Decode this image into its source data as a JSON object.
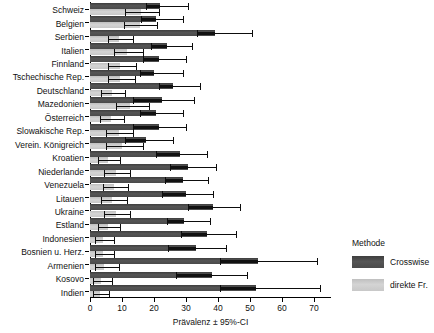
{
  "chart_data": {
    "type": "bar",
    "orientation": "horizontal",
    "title": "",
    "xlabel": "Prävalenz ± 95%-CI",
    "ylabel": "",
    "xlim": [
      0,
      75
    ],
    "xticks": [
      0,
      10,
      20,
      30,
      40,
      50,
      60,
      70
    ],
    "grid": false,
    "legend": {
      "title": "Methode",
      "position": "right",
      "entries": [
        {
          "name": "Crosswise",
          "color": "#4a4a4a"
        },
        {
          "name": "direkte Fr.",
          "color": "#c9c9c9"
        }
      ]
    },
    "categories": [
      "Schweiz",
      "Belgien",
      "Serbien",
      "Italien",
      "Finnland",
      "Tschechische Rep.",
      "Deutschland",
      "Mazedonien",
      "Österreich",
      "Slowakische Rep.",
      "Verein. Königreich",
      "Kroatien",
      "Niederlande",
      "Venezuela",
      "Litauen",
      "Ukraine",
      "Estland",
      "Indonesien",
      "Bosnien u. Herz.",
      "Armenien",
      "Kosovo",
      "Indien"
    ],
    "series": [
      {
        "name": "Crosswise",
        "color": "#4a4a4a",
        "values": [
          22.0,
          20.5,
          39.0,
          24.0,
          21.5,
          20.0,
          26.0,
          22.5,
          20.5,
          21.5,
          17.5,
          28.0,
          30.5,
          29.0,
          30.0,
          38.5,
          29.5,
          36.5,
          33.0,
          52.5,
          38.0,
          52.0
        ],
        "ci_low": [
          17.5,
          16.0,
          33.5,
          19.0,
          16.5,
          15.5,
          21.5,
          13.5,
          15.5,
          13.5,
          11.0,
          20.5,
          25.0,
          23.5,
          22.5,
          30.5,
          24.0,
          28.5,
          24.5,
          40.5,
          27.0,
          40.5
        ],
        "ci_high": [
          30.5,
          29.0,
          50.5,
          32.0,
          30.0,
          29.0,
          34.5,
          32.5,
          29.0,
          30.0,
          26.0,
          36.5,
          39.5,
          37.0,
          38.5,
          47.0,
          37.5,
          45.5,
          42.5,
          71.0,
          49.0,
          72.0
        ]
      },
      {
        "name": "direkte Fr.",
        "color": "#c9c9c9",
        "values": [
          16.0,
          15.5,
          9.0,
          11.5,
          9.5,
          9.5,
          7.0,
          12.5,
          6.5,
          9.0,
          10.0,
          5.5,
          8.0,
          7.5,
          7.0,
          8.0,
          5.5,
          4.0,
          4.0,
          4.5,
          3.5,
          3.0
        ],
        "ci_low": [
          11.0,
          10.5,
          5.5,
          7.5,
          5.5,
          5.5,
          3.5,
          8.0,
          3.0,
          5.0,
          5.0,
          2.5,
          4.5,
          4.0,
          3.5,
          4.5,
          2.5,
          1.5,
          1.5,
          1.5,
          1.0,
          0.8
        ],
        "ci_high": [
          21.5,
          21.0,
          13.5,
          16.5,
          14.5,
          14.0,
          11.0,
          18.5,
          10.5,
          13.5,
          16.5,
          9.5,
          12.5,
          12.0,
          11.5,
          12.5,
          9.5,
          7.5,
          7.5,
          9.0,
          7.0,
          6.0
        ]
      }
    ]
  }
}
